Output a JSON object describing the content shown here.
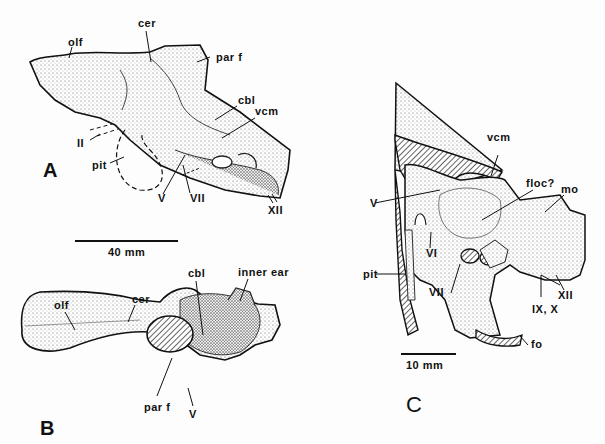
{
  "figure": {
    "panels": [
      {
        "id": "A",
        "view": "lateral endocast",
        "labels": [
          "olf",
          "cer",
          "par f",
          "cbl",
          "vcm",
          "II",
          "pit",
          "V",
          "VII",
          "XII"
        ],
        "scale_bar": "40 mm"
      },
      {
        "id": "B",
        "view": "dorsal endocast",
        "labels": [
          "olf",
          "cer",
          "cbl",
          "inner ear",
          "par f",
          "V"
        ]
      },
      {
        "id": "C",
        "view": "braincase interior",
        "labels": [
          "vcm",
          "V",
          "floc?",
          "mo",
          "VI",
          "pit",
          "VII",
          "XII",
          "IX, X",
          "fo"
        ],
        "scale_bar": "10 mm"
      }
    ],
    "a": {
      "panel": "A",
      "olf": "olf",
      "cer": "cer",
      "parf": "par f",
      "cbl": "cbl",
      "vcm": "vcm",
      "II": "II",
      "pit": "pit",
      "V": "V",
      "VII": "VII",
      "XII": "XII",
      "scale": "40 mm"
    },
    "b": {
      "panel": "B",
      "olf": "olf",
      "cer": "cer",
      "cbl": "cbl",
      "ear": "inner ear",
      "parf": "par f",
      "V": "V"
    },
    "c": {
      "panel": "C",
      "vcm": "vcm",
      "V": "V",
      "floc": "floc?",
      "mo": "mo",
      "VI": "VI",
      "pit": "pit",
      "VII": "VII",
      "XII": "XII",
      "IXX": "IX, X",
      "fo": "fo",
      "scale": "10 mm"
    }
  }
}
